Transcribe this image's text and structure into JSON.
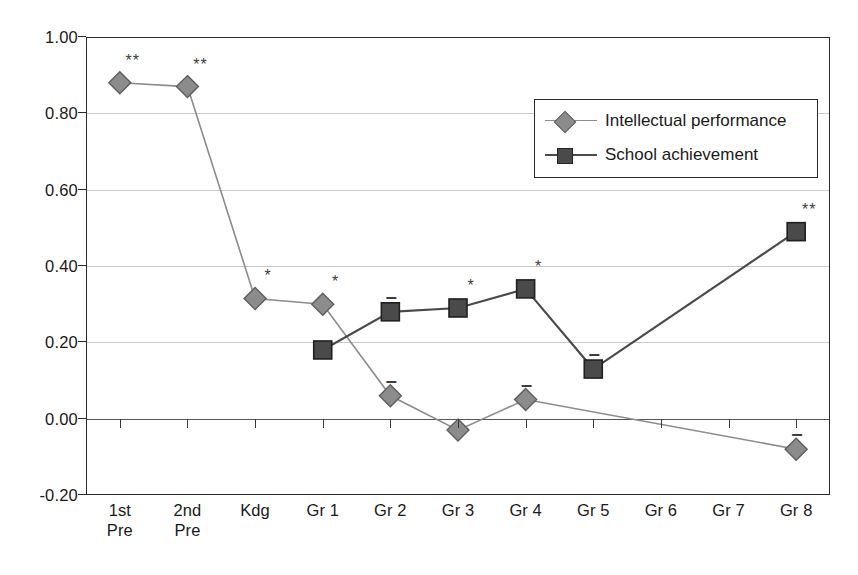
{
  "chart_data": {
    "type": "line",
    "title": "",
    "subtitle": "",
    "xlabel": "",
    "ylabel": "",
    "ylim": [
      -0.2,
      1.0
    ],
    "ytick_labels": [
      "1.00",
      "0.80",
      "0.60",
      "0.40",
      "0.20",
      "0.00",
      "-0.20"
    ],
    "ytick_values": [
      1.0,
      0.8,
      0.6,
      0.4,
      0.2,
      0.0,
      -0.2
    ],
    "grid": true,
    "grid_axis": "y",
    "legend_position": "upper right",
    "categories": [
      "1st\nPre",
      "2nd\nPre",
      "Kdg",
      "Gr 1",
      "Gr 2",
      "Gr 3",
      "Gr 4",
      "Gr 5",
      "Gr 6",
      "Gr 7",
      "Gr 8"
    ],
    "series": [
      {
        "name": "Intellectual performance",
        "marker": "diamond",
        "color": "#8c8c8c",
        "values": [
          0.88,
          0.87,
          0.315,
          0.3,
          0.06,
          -0.03,
          0.05,
          null,
          null,
          null,
          -0.08
        ],
        "annotations": [
          "**",
          "**",
          "*",
          "*",
          "–",
          "",
          "–",
          "",
          "",
          "",
          "–"
        ]
      },
      {
        "name": "School achievement",
        "marker": "square",
        "color": "#4a4a4a",
        "values": [
          null,
          null,
          null,
          0.18,
          0.28,
          0.29,
          0.34,
          0.13,
          null,
          null,
          0.49
        ],
        "annotations": [
          "",
          "",
          "",
          "",
          "–",
          "*",
          "*",
          "–",
          "",
          "",
          "**"
        ]
      }
    ]
  },
  "legend": {
    "items": [
      {
        "label": "Intellectual performance",
        "marker": "diamond",
        "color": "#8c8c8c"
      },
      {
        "label": "School achievement",
        "marker": "square",
        "color": "#4a4a4a"
      }
    ]
  },
  "colors": {
    "axis": "#2b2b2b",
    "grid": "#c9c9c9",
    "zero_line": "#555555",
    "intellectual_performance": "#8c8c8c",
    "school_achievement": "#4a4a4a",
    "background": "#ffffff"
  }
}
